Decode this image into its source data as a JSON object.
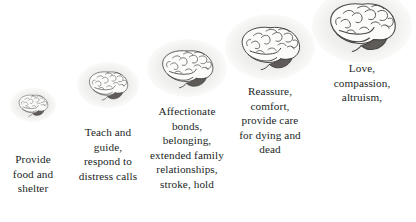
{
  "diagram": {
    "background_color": "#ffffff",
    "text_color": "#211f1e",
    "halo_color": "#ececea",
    "brain_outline_color": "#4a4846",
    "brain_fill_color": "#fbfbfa",
    "cerebellum_color": "#5e5b58",
    "stages": [
      {
        "index": 1,
        "icon": "brain-icon",
        "caption": "Provide\nfood and\nshelter",
        "brain_width": 34,
        "brain_height": 24,
        "halo_width": 46,
        "halo_height": 34,
        "center_x": 33,
        "brain_center_y": 105,
        "caption_top": 152,
        "caption_width": 80,
        "font_size": 11.2
      },
      {
        "index": 2,
        "icon": "brain-icon",
        "caption": "Teach and\nguide,\nrespond to\ndistress calls",
        "brain_width": 46,
        "brain_height": 32,
        "halo_width": 62,
        "halo_height": 46,
        "center_x": 108,
        "brain_center_y": 85,
        "caption_top": 125,
        "caption_width": 92,
        "font_size": 11.2
      },
      {
        "index": 3,
        "icon": "brain-icon",
        "caption": "Affectionate\nbonds,\nbelonging,\nextended family\nrelationships,\nstroke, hold",
        "brain_width": 60,
        "brain_height": 42,
        "halo_width": 80,
        "halo_height": 58,
        "center_x": 187,
        "brain_center_y": 68,
        "caption_top": 104,
        "caption_width": 104,
        "font_size": 11.2
      },
      {
        "index": 4,
        "icon": "brain-icon",
        "caption": "Reassure,\ncomfort,\nprovide care\nfor dying and\ndead",
        "brain_width": 68,
        "brain_height": 48,
        "halo_width": 90,
        "halo_height": 66,
        "center_x": 270,
        "brain_center_y": 47,
        "caption_top": 84,
        "caption_width": 100,
        "font_size": 11.2
      },
      {
        "index": 5,
        "icon": "brain-icon",
        "caption": "Love,\ncompassion,\naltruism,",
        "brain_width": 76,
        "brain_height": 54,
        "halo_width": 100,
        "halo_height": 74,
        "center_x": 362,
        "brain_center_y": 26,
        "caption_top": 61,
        "caption_width": 96,
        "font_size": 11.2
      }
    ]
  }
}
